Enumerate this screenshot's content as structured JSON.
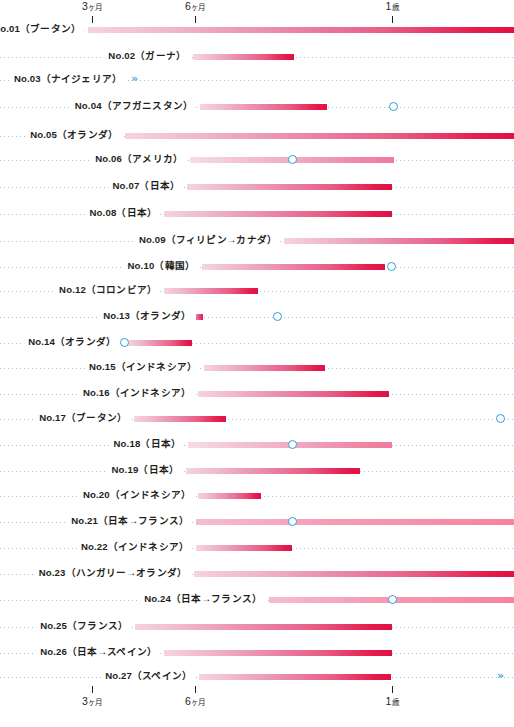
{
  "chart_data": {
    "type": "bar",
    "title": "",
    "subtitle": "",
    "xlabel": "",
    "ylabel": "",
    "orientation": "horizontal",
    "grid": true,
    "legend_position": "none",
    "xlim_px": [
      0,
      514
    ],
    "axis": {
      "ticks": [
        {
          "label": "3",
          "unit": "ヶ月",
          "x": 92
        },
        {
          "label": "6",
          "unit": "ヶ月",
          "x": 195
        },
        {
          "label": "1",
          "unit": "歳",
          "x": 392
        }
      ],
      "top_axis": true,
      "bottom_axis": true
    },
    "colors": {
      "bar_start": "#f5d3df",
      "bar_end": "#e01046",
      "accent_pink": "#e51a4c",
      "marker_blue": "#2f9fd6",
      "dotted_blue": "#8ec6e8",
      "text": "#231f20"
    },
    "categories": [
      "No.01（ブータン）",
      "No.02（ガーナ）",
      "No.03（ナイジェリア）",
      "No.04（アフガニスタン）",
      "No.05（オランダ）",
      "No.06（アメリカ）",
      "No.07（日本）",
      "No.08（日本）",
      "No.09（フィリピン→カナダ）",
      "No.10（韓国）",
      "No.12（コロンビア）",
      "No.13（オランダ）",
      "No.14（オランダ）",
      "No.15（インドネシア）",
      "No.16（インドネシア）",
      "No.17（ブータン）",
      "No.18（日本）",
      "No.19（日本）",
      "No.20（インドネシア）",
      "No.21（日本→フランス）",
      "No.22（インドネシア）",
      "No.23（ハンガリー→オランダ）",
      "No.24（日本→フランス）",
      "No.25（フランス）",
      "No.26（日本→スペイン）",
      "No.27（スペイン）"
    ],
    "rows": [
      {
        "label": "No.01（ブータン）",
        "y": 31,
        "label_x": 84,
        "bar_start": 88,
        "bar_end": 514,
        "style": "bar",
        "marker": null,
        "chevron": null
      },
      {
        "label": "No.02（ガーナ）",
        "y": 58,
        "label_x": 189,
        "bar_start": 193,
        "bar_end": 294,
        "style": "bar",
        "marker": null,
        "chevron": null
      },
      {
        "label": "No.03（ナイジェリア）",
        "y": 81,
        "label_x": 125,
        "bar_start": null,
        "bar_end": null,
        "style": "none",
        "marker": null,
        "chevron": 131
      },
      {
        "label": "No.04（アフガニスタン）",
        "y": 108,
        "label_x": 196,
        "bar_start": 200,
        "bar_end": 327,
        "style": "bar",
        "marker": 393,
        "chevron": null
      },
      {
        "label": "No.05（オランダ）",
        "y": 137,
        "label_x": 121,
        "bar_start": 125,
        "bar_end": 514,
        "style": "bar",
        "marker": null,
        "chevron": null
      },
      {
        "label": "No.06（アメリカ）",
        "y": 161,
        "label_x": 186,
        "bar_start": 190,
        "bar_end": 394,
        "style": "soft",
        "marker": 292,
        "chevron": null
      },
      {
        "label": "No.07（日本）",
        "y": 188,
        "label_x": 183,
        "bar_start": 187,
        "bar_end": 392,
        "style": "bar",
        "marker": null,
        "chevron": null
      },
      {
        "label": "No.08（日本）",
        "y": 215,
        "label_x": 160,
        "bar_start": 164,
        "bar_end": 392,
        "style": "bar",
        "marker": null,
        "chevron": null
      },
      {
        "label": "No.09（フィリピン→カナダ）",
        "y": 242,
        "label_x": 280,
        "bar_start": 284,
        "bar_end": 514,
        "style": "bar",
        "marker": null,
        "chevron": null
      },
      {
        "label": "No.10（韓国）",
        "y": 268,
        "label_x": 198,
        "bar_start": 202,
        "bar_end": 385,
        "style": "bar",
        "marker": 391,
        "chevron": null
      },
      {
        "label": "No.12（コロンビア）",
        "y": 292,
        "label_x": 160,
        "bar_start": 164,
        "bar_end": 258,
        "style": "bar",
        "marker": null,
        "chevron": null
      },
      {
        "label": "No.13（オランダ）",
        "y": 318,
        "label_x": 194,
        "bar_start": 196,
        "bar_end": 203,
        "style": "tiny",
        "marker": 277,
        "chevron": null
      },
      {
        "label": "No.14（オランダ）",
        "y": 344,
        "label_x": 119,
        "bar_start": 128,
        "bar_end": 192,
        "style": "bar",
        "marker": 124,
        "chevron": null
      },
      {
        "label": "No.15（インドネシア）",
        "y": 369,
        "label_x": 200,
        "bar_start": 204,
        "bar_end": 325,
        "style": "bar",
        "marker": null,
        "chevron": null
      },
      {
        "label": "No.16（インドネシア）",
        "y": 395,
        "label_x": 194,
        "bar_start": 198,
        "bar_end": 389,
        "style": "bar",
        "marker": null,
        "chevron": null
      },
      {
        "label": "No.17（ブータン）",
        "y": 420,
        "label_x": 130,
        "bar_start": 134,
        "bar_end": 226,
        "style": "bar",
        "marker": 500,
        "chevron": null
      },
      {
        "label": "No.18（日本）",
        "y": 446,
        "label_x": 184,
        "bar_start": 188,
        "bar_end": 392,
        "style": "soft",
        "marker": 292,
        "chevron": null
      },
      {
        "label": "No.19（日本）",
        "y": 472,
        "label_x": 182,
        "bar_start": 186,
        "bar_end": 360,
        "style": "bar",
        "marker": null,
        "chevron": null
      },
      {
        "label": "No.20（インドネシア）",
        "y": 497,
        "label_x": 194,
        "bar_start": 198,
        "bar_end": 261,
        "style": "bar",
        "marker": null,
        "chevron": null
      },
      {
        "label": "No.21（日本→フランス）",
        "y": 523,
        "label_x": 192,
        "bar_start": 196,
        "bar_end": 514,
        "style": "openright",
        "marker": 292,
        "chevron": null
      },
      {
        "label": "No.22（インドネシア）",
        "y": 549,
        "label_x": 192,
        "bar_start": 196,
        "bar_end": 292,
        "style": "bar",
        "marker": null,
        "chevron": null
      },
      {
        "label": "No.23（ハンガリー→オランダ）",
        "y": 575,
        "label_x": 190,
        "bar_start": 194,
        "bar_end": 514,
        "style": "bar",
        "marker": null,
        "chevron": null
      },
      {
        "label": "No.24（日本→フランス）",
        "y": 601,
        "label_x": 265,
        "bar_start": 269,
        "bar_end": 514,
        "style": "openright",
        "marker": 392,
        "chevron": null
      },
      {
        "label": "No.25（フランス）",
        "y": 628,
        "label_x": 131,
        "bar_start": 135,
        "bar_end": 392,
        "style": "bar",
        "marker": null,
        "chevron": null
      },
      {
        "label": "No.26（日本→スペイン）",
        "y": 654,
        "label_x": 160,
        "bar_start": 164,
        "bar_end": 392,
        "style": "bar",
        "marker": null,
        "chevron": null
      },
      {
        "label": "No.27（スペイン）",
        "y": 678,
        "label_x": 195,
        "bar_start": 199,
        "bar_end": 391,
        "style": "bar",
        "marker": null,
        "chevron": 497
      }
    ],
    "annotations": {
      "marker_meaning": "open blue circle",
      "chevron_meaning": "double chevron (continues)"
    }
  }
}
